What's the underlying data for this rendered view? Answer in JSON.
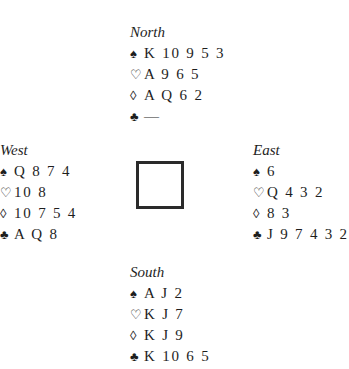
{
  "hands": {
    "north": {
      "seat": "North",
      "spades": "K 10 9 5 3",
      "hearts": "A 9 6 5",
      "diamonds": "A Q 6 2",
      "clubs": "—"
    },
    "west": {
      "seat": "West",
      "spades": "Q 8 7 4",
      "hearts": "10 8",
      "diamonds": "10 7 5 4",
      "clubs": "A Q 8"
    },
    "east": {
      "seat": "East",
      "spades": "6",
      "hearts": "Q 4 3 2",
      "diamonds": "8 3",
      "clubs": "J 9 7 4 3 2"
    },
    "south": {
      "seat": "South",
      "spades": "A J 2",
      "hearts": "K J 7",
      "diamonds": "K J 9",
      "clubs": "K 10 6 5"
    }
  },
  "suit_symbols": {
    "spades": "♠",
    "hearts": "♡",
    "diamonds": "◊",
    "clubs": "♣"
  }
}
